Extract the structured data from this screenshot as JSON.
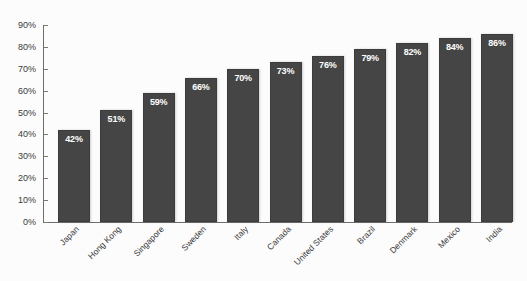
{
  "chart_data": {
    "type": "bar",
    "title": "",
    "subtitle": "",
    "xlabel": "",
    "ylabel": "",
    "ylim": [
      0,
      90
    ],
    "ytick_step": 10,
    "grid": false,
    "legend": "none",
    "orientation": "vertical",
    "value_label_suffix": "%",
    "value_label_position": "inside-top",
    "categories": [
      "Japan",
      "Hong Kong",
      "Singapore",
      "Sweden",
      "Italy",
      "Canada",
      "United States",
      "Brazil",
      "Denmark",
      "Mexico",
      "India"
    ],
    "values": [
      42,
      51,
      59,
      66,
      70,
      73,
      76,
      79,
      82,
      84,
      86
    ],
    "value_labels": [
      "42%",
      "51%",
      "59%",
      "66%",
      "70%",
      "73%",
      "76%",
      "79%",
      "82%",
      "84%",
      "86%"
    ],
    "ytick_labels": [
      "0%",
      "10%",
      "20%",
      "30%",
      "40%",
      "50%",
      "60%",
      "70%",
      "80%",
      "90%"
    ],
    "ytick_values": [
      0,
      10,
      20,
      30,
      40,
      50,
      60,
      70,
      80,
      90
    ],
    "colors": {
      "bar_fill": "#454545",
      "bar_border": "#3c3c3c",
      "value_label": "#ffffff",
      "axis_line": "#6d6d6d",
      "tick_mark": "#7a7a7a",
      "tick_label": "#3a3a3a",
      "category_label": "#3a3a3a",
      "plot_background": "#fcfcfc"
    },
    "category_label_rotation_deg": -45
  }
}
